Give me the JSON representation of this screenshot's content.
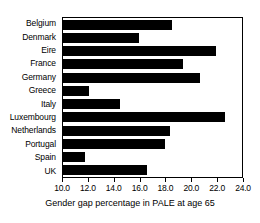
{
  "chart_data": {
    "type": "bar",
    "orientation": "horizontal",
    "title": "",
    "xlabel": "Gender gap percentage in PALE at age 65",
    "ylabel": "",
    "categories": [
      "Belgium",
      "Denmark",
      "Eire",
      "France",
      "Germany",
      "Greece",
      "Italy",
      "Luxembourg",
      "Netherlands",
      "Portugal",
      "Spain",
      "UK"
    ],
    "values": [
      18.4,
      15.9,
      21.8,
      19.3,
      20.6,
      12.0,
      14.4,
      22.5,
      18.3,
      17.9,
      11.7,
      16.5
    ],
    "xlim": [
      10.0,
      24.0
    ],
    "xticks": [
      "10.0",
      "12.0",
      "14.0",
      "16.0",
      "18.0",
      "20.0",
      "22.0",
      "24.0"
    ],
    "xtick_values": [
      10.0,
      12.0,
      14.0,
      16.0,
      18.0,
      20.0,
      22.0,
      24.0
    ],
    "grid": false,
    "legend": false,
    "bar_color": "#000000",
    "frame_color": "#000000",
    "background_color": "#ffffff"
  }
}
